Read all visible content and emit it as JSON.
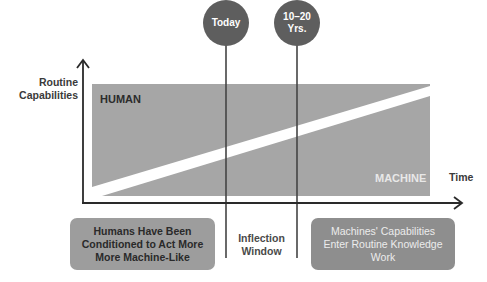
{
  "milestones": [
    {
      "label": "Today",
      "x": 226
    },
    {
      "label": "10–20 Yrs.",
      "line1": "10–20",
      "line2": "Yrs.",
      "x": 297
    }
  ],
  "axes": {
    "y_label_line1": "Routine",
    "y_label_line2": "Capabilities",
    "x_label": "Time"
  },
  "areas": {
    "upper": "HUMAN",
    "lower": "MACHINE"
  },
  "bottom": {
    "left_box_line1": "Humans Have Been",
    "left_box_line2": "Conditioned to Act More",
    "left_box_line3": "More Machine-Like",
    "middle_line1": "Inflection",
    "middle_line2": "Window",
    "right_box_line1": "Machines' Capabilities",
    "right_box_line2": "Enter Routine Knowledge",
    "right_box_line3": "Work"
  },
  "colors": {
    "circle": "#5e5e5e",
    "area_fill": "#a6a6a6",
    "left_box": "#9d9d9d",
    "right_box": "#8e8e8e",
    "axis": "#2a2a2a",
    "divider": "#444444"
  }
}
